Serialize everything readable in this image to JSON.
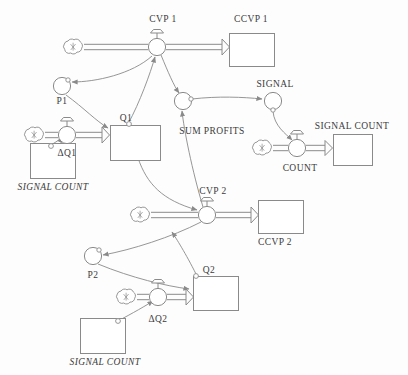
{
  "diagram": {
    "type": "system-dynamics-stock-flow",
    "title_visible": false,
    "palette": {
      "line": "#8a8a8a",
      "stroke_dark": "#6f6f6f",
      "text": "#3b3b3b",
      "background": "#fdfdfd",
      "fill": "#ffffff"
    },
    "labels": [
      {
        "id": "cvp1",
        "text": "CVP 1",
        "x": 163,
        "y": 14,
        "italic": false,
        "align": "center"
      },
      {
        "id": "ccvp1",
        "text": "CCVP 1",
        "x": 251,
        "y": 14,
        "italic": false,
        "align": "center"
      },
      {
        "id": "p1",
        "text": "P1",
        "x": 62,
        "y": 96,
        "italic": false,
        "align": "center"
      },
      {
        "id": "q1",
        "text": "Q1",
        "x": 126,
        "y": 113,
        "italic": false,
        "align": "center"
      },
      {
        "id": "dq1",
        "text": "ΔQ1",
        "x": 67,
        "y": 148,
        "italic": false,
        "align": "center"
      },
      {
        "id": "signal-count-left-1",
        "text": "SIGNAL COUNT",
        "x": 53,
        "y": 182,
        "italic": true,
        "align": "center"
      },
      {
        "id": "sum-profits",
        "text": "SUM PROFITS",
        "x": 212,
        "y": 126,
        "italic": false,
        "align": "center"
      },
      {
        "id": "signal",
        "text": "SIGNAL",
        "x": 275,
        "y": 79,
        "italic": false,
        "align": "center"
      },
      {
        "id": "signal-count-right",
        "text": "SIGNAL COUNT",
        "x": 352,
        "y": 121,
        "italic": false,
        "align": "center"
      },
      {
        "id": "count",
        "text": "COUNT",
        "x": 300,
        "y": 163,
        "italic": false,
        "align": "center"
      },
      {
        "id": "cvp2",
        "text": "CVP 2",
        "x": 213,
        "y": 186,
        "italic": false,
        "align": "center"
      },
      {
        "id": "ccvp2",
        "text": "CCVP 2",
        "x": 275,
        "y": 237,
        "italic": false,
        "align": "center"
      },
      {
        "id": "p2",
        "text": "P2",
        "x": 93,
        "y": 270,
        "italic": false,
        "align": "center"
      },
      {
        "id": "q2",
        "text": "Q2",
        "x": 209,
        "y": 265,
        "italic": false,
        "align": "center"
      },
      {
        "id": "dq2",
        "text": "ΔQ2",
        "x": 158,
        "y": 314,
        "italic": false,
        "align": "center"
      },
      {
        "id": "signal-count-left-2",
        "text": "SIGNAL COUNT",
        "x": 105,
        "y": 357,
        "italic": true,
        "align": "center"
      }
    ],
    "stocks": [
      {
        "id": "ccvp1-box",
        "label_ref": "ccvp1",
        "x": 229,
        "y": 33,
        "w": 45,
        "h": 33
      },
      {
        "id": "q1-box",
        "label_ref": "q1",
        "x": 110,
        "y": 125,
        "w": 50,
        "h": 35
      },
      {
        "id": "signal-count-left-1-box",
        "label_ref": "signal-count-left-1",
        "x": 30,
        "y": 143,
        "w": 45,
        "h": 35
      },
      {
        "id": "signal-count-right-box",
        "label_ref": "signal-count-right",
        "x": 333,
        "y": 134,
        "w": 39,
        "h": 31
      },
      {
        "id": "ccvp2-box",
        "label_ref": "ccvp2",
        "x": 258,
        "y": 200,
        "w": 45,
        "h": 33
      },
      {
        "id": "q2-box",
        "label_ref": "q2",
        "x": 193,
        "y": 276,
        "w": 45,
        "h": 34
      },
      {
        "id": "signal-count-left-2-box",
        "label_ref": "signal-count-left-2",
        "x": 80,
        "y": 318,
        "w": 45,
        "h": 35
      }
    ],
    "flow_valves": [
      {
        "id": "cvp1-valve",
        "label_ref": "cvp1",
        "cx": 157,
        "cy": 47,
        "r": 9
      },
      {
        "id": "dq1-valve",
        "label_ref": "dq1",
        "cx": 67,
        "cy": 135,
        "r": 9
      },
      {
        "id": "count-valve",
        "label_ref": "count",
        "cx": 297,
        "cy": 148,
        "r": 9
      },
      {
        "id": "cvp2-valve",
        "label_ref": "cvp2",
        "cx": 207,
        "cy": 215,
        "r": 9
      },
      {
        "id": "dq2-valve",
        "label_ref": "dq2",
        "cx": 158,
        "cy": 297,
        "r": 9
      }
    ],
    "auxiliaries": [
      {
        "id": "p1-aux",
        "label_ref": "p1",
        "cx": 62,
        "cy": 86,
        "r": 9
      },
      {
        "id": "sum-profits-aux",
        "label_ref": "sum-profits",
        "cx": 183,
        "cy": 101,
        "r": 9
      },
      {
        "id": "signal-aux",
        "label_ref": "signal",
        "cx": 273,
        "cy": 101,
        "r": 9
      },
      {
        "id": "p2-aux",
        "label_ref": "p2",
        "cx": 93,
        "cy": 256,
        "r": 9
      }
    ],
    "clouds": [
      {
        "id": "cloud-cvp1",
        "cx": 73,
        "cy": 46
      },
      {
        "id": "cloud-dq1",
        "cx": 34,
        "cy": 134
      },
      {
        "id": "cloud-count",
        "cx": 262,
        "cy": 148
      },
      {
        "id": "cloud-cvp2",
        "cx": 140,
        "cy": 214
      },
      {
        "id": "cloud-dq2",
        "cx": 126,
        "cy": 296
      }
    ],
    "flows": [
      {
        "id": "flow-cloud-to-cvp1",
        "from": "cloud-cvp1",
        "to": "cvp1-valve"
      },
      {
        "id": "flow-cvp1-to-ccvp1",
        "from": "cvp1-valve",
        "to": "ccvp1-box"
      },
      {
        "id": "flow-cloud-to-dq1",
        "from": "cloud-dq1",
        "to": "dq1-valve"
      },
      {
        "id": "flow-dq1-to-q1",
        "from": "dq1-valve",
        "to": "q1-box"
      },
      {
        "id": "flow-cloud-to-count",
        "from": "cloud-count",
        "to": "count-valve"
      },
      {
        "id": "flow-count-to-signal-count",
        "from": "count-valve",
        "to": "signal-count-right-box"
      },
      {
        "id": "flow-cloud-to-cvp2",
        "from": "cloud-cvp2",
        "to": "cvp2-valve"
      },
      {
        "id": "flow-cvp2-to-ccvp2",
        "from": "cvp2-valve",
        "to": "ccvp2-box"
      },
      {
        "id": "flow-cloud-to-dq2",
        "from": "cloud-dq2",
        "to": "dq2-valve"
      },
      {
        "id": "flow-dq2-to-q2",
        "from": "dq2-valve",
        "to": "q2-box"
      }
    ],
    "connectors": [
      {
        "id": "conn-cvp1-to-p1",
        "from": "cvp1-valve",
        "to": "p1-aux"
      },
      {
        "id": "conn-p1-to-q1",
        "from": "p1-aux",
        "to": "q1-box"
      },
      {
        "id": "conn-q1-to-cvp1",
        "from": "q1-box",
        "to": "cvp1-valve"
      },
      {
        "id": "conn-cvp1-to-sum-profits",
        "from": "cvp1-valve",
        "to": "sum-profits-aux"
      },
      {
        "id": "conn-cvp2-to-sum-profits",
        "from": "cvp2-valve",
        "to": "sum-profits-aux"
      },
      {
        "id": "conn-sum-profits-to-signal",
        "from": "sum-profits-aux",
        "to": "signal-aux"
      },
      {
        "id": "conn-signal-to-count",
        "from": "signal-aux",
        "to": "count-valve"
      },
      {
        "id": "conn-signal-count-1-to-dq1",
        "from": "signal-count-left-1-box",
        "to": "dq1-valve"
      },
      {
        "id": "conn-q1-to-cvp2",
        "from": "q1-box",
        "to": "cvp2-valve"
      },
      {
        "id": "conn-cvp2-to-p2",
        "from": "cvp2-valve",
        "to": "p2-aux"
      },
      {
        "id": "conn-p2-to-q2",
        "from": "p2-aux",
        "to": "q2-box"
      },
      {
        "id": "conn-q2-to-cvp2",
        "from": "q2-box",
        "to": "cvp2-valve"
      },
      {
        "id": "conn-signal-count-2-to-dq2",
        "from": "signal-count-left-2-box",
        "to": "dq2-valve"
      }
    ]
  }
}
